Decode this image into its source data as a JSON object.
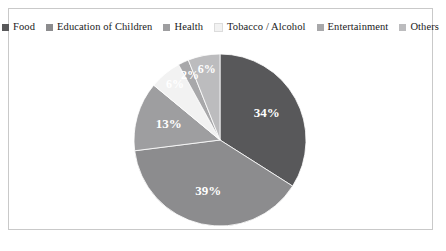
{
  "chart_data": {
    "type": "pie",
    "title": "",
    "categories": [
      "Food",
      "Education of Children",
      "Health",
      "Tobacco / Alcohol",
      "Entertainment",
      "Others"
    ],
    "values": [
      34,
      39,
      13,
      6,
      2,
      6
    ],
    "value_labels": [
      "34%",
      "39%",
      "13%",
      "6%",
      "2%",
      "6%"
    ],
    "colors": [
      "#58585a",
      "#8c8c8e",
      "#9e9ea0",
      "#f2f2f2",
      "#a8a8aa",
      "#bcbcbe"
    ],
    "legend_position": "top",
    "start_angle": 0,
    "direction": "clockwise",
    "units": "percent"
  },
  "legend": {
    "items": [
      {
        "label": "Food",
        "color": "#58585a"
      },
      {
        "label": "Education of Children",
        "color": "#8c8c8e"
      },
      {
        "label": "Health",
        "color": "#9e9ea0"
      },
      {
        "label": "Tobacco / Alcohol",
        "color": "#f2f2f2"
      },
      {
        "label": "Entertainment",
        "color": "#a8a8aa"
      },
      {
        "label": "Others",
        "color": "#bcbcbe"
      }
    ]
  },
  "frame": {
    "border_color": "#c9c9c9",
    "background": "#ffffff"
  }
}
